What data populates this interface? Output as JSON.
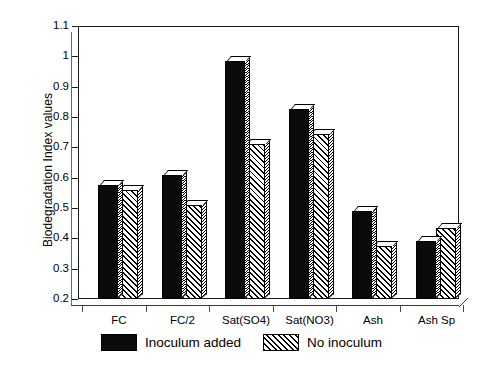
{
  "chart_data": {
    "type": "bar",
    "title": "",
    "xlabel": "",
    "ylabel": "Biodegradation Index values",
    "ylim": [
      0.2,
      1.1
    ],
    "ytick_labels": [
      "1.1",
      "1",
      "0.9",
      "0.8",
      "0.7",
      "0.6",
      "0.5",
      "0.4",
      "0.3",
      "0.2"
    ],
    "ytick_values": [
      1.1,
      1.0,
      0.9,
      0.8,
      0.7,
      0.6,
      0.5,
      0.4,
      0.3,
      0.2
    ],
    "grid": false,
    "legend_position": "below",
    "categories": [
      "FC",
      "FC/2",
      "Sat(SO4)",
      "Sat(NO3)",
      "Ash",
      "Ash Sp"
    ],
    "series": [
      {
        "name": "Inoculum added",
        "fill": "solid",
        "color": "#0a0a0a",
        "values": [
          0.575,
          0.61,
          0.985,
          0.825,
          0.49,
          0.39
        ]
      },
      {
        "name": "No inoculum",
        "fill": "hatch",
        "color": "#ffffff",
        "values": [
          0.56,
          0.51,
          0.71,
          0.745,
          0.375,
          0.435
        ]
      }
    ]
  },
  "legend": {
    "items": [
      {
        "label": "Inoculum added"
      },
      {
        "label": "No inoculum"
      }
    ]
  }
}
